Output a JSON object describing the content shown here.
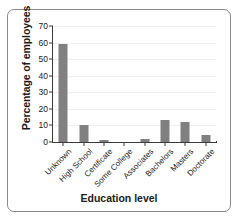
{
  "chart_data": {
    "type": "bar",
    "title": "",
    "xlabel": "Education level",
    "ylabel": "Percentage of employees",
    "categories": [
      "Unknown",
      "High School",
      "Certificate",
      "Some College",
      "Associates",
      "Bachelors",
      "Masters",
      "Doctorate"
    ],
    "values": [
      59,
      10,
      1,
      0,
      2,
      13,
      12,
      4
    ],
    "ylim": [
      0,
      70
    ],
    "yticks": [
      0,
      10,
      20,
      30,
      40,
      50,
      60,
      70
    ],
    "grid": true,
    "legend": "none",
    "bar_color": "#808080",
    "axis_color": "#3a3a3a",
    "frame_color": "#8a8a8a",
    "background_color": "#ffffff"
  }
}
